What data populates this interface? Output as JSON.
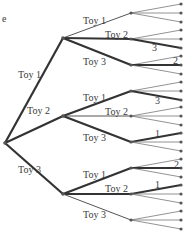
{
  "fragment_text": "e",
  "level1": [
    {
      "label": "Toy 1"
    },
    {
      "label": "Toy 2"
    },
    {
      "label": "Toy 3"
    }
  ],
  "level2": [
    {
      "label": "Toy 1"
    },
    {
      "label": "Toy 2"
    },
    {
      "label": "Toy 3"
    },
    {
      "label": "Toy 1"
    },
    {
      "label": "Toy 2"
    },
    {
      "label": "Toy 3"
    },
    {
      "label": "Toy 1"
    },
    {
      "label": "Toy 2"
    },
    {
      "label": "Toy 3"
    }
  ],
  "leaf_annotations": [
    {
      "text": "3"
    },
    {
      "text": "2"
    },
    {
      "text": "3"
    },
    {
      "text": "1"
    },
    {
      "text": "2"
    },
    {
      "text": "1"
    }
  ],
  "colors": {
    "line": "#333333",
    "thin_line": "#7a7a7a",
    "node": "#555555"
  }
}
